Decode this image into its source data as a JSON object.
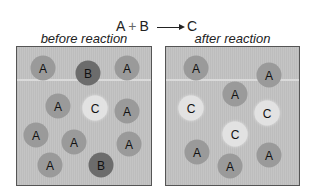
{
  "equation": {
    "reactant1": "A",
    "plus": "+",
    "reactant2": "B",
    "product": "C"
  },
  "panels": [
    {
      "label": "before reaction",
      "molecules": [
        {
          "type": "A",
          "x": 26,
          "y": 21
        },
        {
          "type": "B",
          "x": 71,
          "y": 26
        },
        {
          "type": "A",
          "x": 110,
          "y": 21
        },
        {
          "type": "A",
          "x": 41,
          "y": 59
        },
        {
          "type": "C",
          "x": 78,
          "y": 61
        },
        {
          "type": "A",
          "x": 110,
          "y": 64
        },
        {
          "type": "A",
          "x": 19,
          "y": 88
        },
        {
          "type": "A",
          "x": 57,
          "y": 95
        },
        {
          "type": "A",
          "x": 112,
          "y": 97
        },
        {
          "type": "A",
          "x": 33,
          "y": 118
        },
        {
          "type": "B",
          "x": 84,
          "y": 118
        }
      ]
    },
    {
      "label": "after reaction",
      "molecules": [
        {
          "type": "A",
          "x": 30,
          "y": 21
        },
        {
          "type": "A",
          "x": 103,
          "y": 28
        },
        {
          "type": "A",
          "x": 69,
          "y": 47
        },
        {
          "type": "C",
          "x": 25,
          "y": 61
        },
        {
          "type": "C",
          "x": 101,
          "y": 66
        },
        {
          "type": "C",
          "x": 69,
          "y": 87
        },
        {
          "type": "A",
          "x": 31,
          "y": 105
        },
        {
          "type": "A",
          "x": 64,
          "y": 119
        },
        {
          "type": "A",
          "x": 103,
          "y": 108
        }
      ]
    }
  ],
  "colors": {
    "A": "#9a9a9a",
    "B": "#6c6c6c",
    "C": "#e2e2e2",
    "container": "#c0c0c0"
  }
}
